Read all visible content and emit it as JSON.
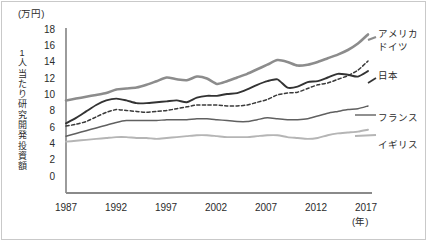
{
  "chart_data": {
    "type": "line",
    "title": "",
    "unit_label": "(万円)",
    "ylabel": "1人当たり研究開発投資額",
    "xlabel": "(年)",
    "ylim": [
      0,
      18
    ],
    "xlim": [
      1987,
      2017
    ],
    "grid": false,
    "legend_position": "right-of-plot",
    "ytick_labels": [
      "18",
      "16",
      "14",
      "12",
      "10",
      "8",
      "6",
      "4",
      "2",
      "0"
    ],
    "ytick_values": [
      18,
      16,
      14,
      12,
      10,
      8,
      6,
      4,
      2,
      0
    ],
    "xtick_labels": [
      "1987",
      "1992",
      "1997",
      "2002",
      "2007",
      "2012",
      "2017"
    ],
    "xtick_values": [
      1987,
      1992,
      1997,
      2002,
      2007,
      2012,
      2017
    ],
    "x": [
      1987,
      1988,
      1989,
      1990,
      1991,
      1992,
      1993,
      1994,
      1995,
      1996,
      1997,
      1998,
      1999,
      2000,
      2001,
      2002,
      2003,
      2004,
      2005,
      2006,
      2007,
      2008,
      2009,
      2010,
      2011,
      2012,
      2013,
      2014,
      2015,
      2016,
      2017
    ],
    "series": [
      {
        "name": "アメリカ",
        "color": "#8c8c8c",
        "style": "solid",
        "width": 2.6,
        "values": [
          10.1,
          10.3,
          10.5,
          10.7,
          10.9,
          11.3,
          11.4,
          11.5,
          11.8,
          12.2,
          12.6,
          12.4,
          12.3,
          12.7,
          12.5,
          11.9,
          12.2,
          12.6,
          13.0,
          13.5,
          14.0,
          14.5,
          14.3,
          13.9,
          14.0,
          14.3,
          14.7,
          15.1,
          15.6,
          16.3,
          17.3
        ]
      },
      {
        "name": "ドイツ",
        "color": "#3a3a3a",
        "style": "dashed",
        "width": 1.5,
        "values": [
          7.3,
          7.5,
          7.8,
          8.3,
          8.8,
          9.1,
          9.0,
          8.9,
          8.8,
          8.9,
          9.0,
          9.2,
          9.4,
          9.6,
          9.6,
          9.6,
          9.5,
          9.5,
          9.6,
          9.9,
          10.2,
          10.7,
          10.9,
          11.0,
          11.4,
          11.8,
          12.0,
          12.4,
          12.8,
          13.4,
          14.4
        ]
      },
      {
        "name": "日本",
        "color": "#333333",
        "style": "solid",
        "width": 1.9,
        "values": [
          7.6,
          8.2,
          8.9,
          9.6,
          10.1,
          10.3,
          10.1,
          9.8,
          9.8,
          9.9,
          10.0,
          10.1,
          9.9,
          10.4,
          10.6,
          10.6,
          10.8,
          10.9,
          11.3,
          11.8,
          12.2,
          12.4,
          11.5,
          11.6,
          12.1,
          12.2,
          12.6,
          13.0,
          12.9,
          12.7,
          13.3
        ]
      },
      {
        "name": "フランス",
        "color": "#606060",
        "style": "solid",
        "width": 1.5,
        "values": [
          6.2,
          6.5,
          6.8,
          7.1,
          7.4,
          7.7,
          7.9,
          7.9,
          7.9,
          7.9,
          8.0,
          8.0,
          8.0,
          8.1,
          8.1,
          8.0,
          7.9,
          7.8,
          7.8,
          8.0,
          8.2,
          8.1,
          8.0,
          8.0,
          8.1,
          8.4,
          8.7,
          8.9,
          9.1,
          9.2,
          9.5
        ]
      },
      {
        "name": "イギリス",
        "color": "#b5b5b5",
        "style": "solid",
        "width": 1.9,
        "values": [
          5.6,
          5.7,
          5.8,
          5.9,
          6.0,
          6.1,
          6.1,
          6.0,
          6.0,
          5.9,
          6.0,
          6.1,
          6.2,
          6.3,
          6.3,
          6.2,
          6.1,
          6.1,
          6.1,
          6.2,
          6.3,
          6.3,
          6.1,
          6.0,
          5.9,
          6.0,
          6.3,
          6.5,
          6.6,
          6.7,
          6.9
        ]
      }
    ]
  },
  "legend": {
    "items": [
      {
        "label": "アメリカ"
      },
      {
        "label": "ドイツ"
      },
      {
        "label": "日本"
      },
      {
        "label": "フランス"
      },
      {
        "label": "イギリス"
      }
    ]
  }
}
